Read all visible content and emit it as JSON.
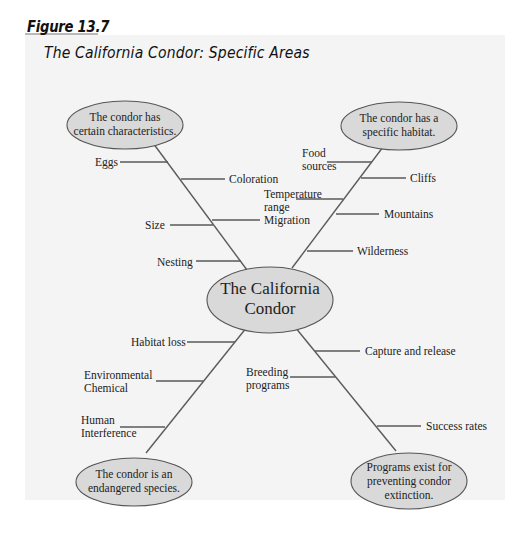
{
  "figure": {
    "label": "Figure 13.7",
    "title": "The California Condor: Specific Areas"
  },
  "colors": {
    "panel_bg": "#f4f4f4",
    "tab_bg": "#b9b9b9",
    "node_fill": "#d9d9d9",
    "line": "#555555"
  },
  "center": {
    "line1": "The California",
    "line2": "Condor"
  },
  "nodes": {
    "characteristics": {
      "line1": "The condor has",
      "line2": "certain characteristics.",
      "details": [
        "Eggs",
        "Coloration",
        "Size",
        "Migration",
        "Nesting"
      ]
    },
    "habitat": {
      "line1": "The condor has a",
      "line2": "specific habitat.",
      "details": [
        "Food sources",
        "Cliffs",
        "Temperature range",
        "Mountains",
        "Wilderness"
      ]
    },
    "endangered": {
      "line1": "The condor is an",
      "line2": "endangered species.",
      "details": [
        "Habitat loss",
        "Environmental Chemical",
        "Human Interference"
      ]
    },
    "programs": {
      "line1": "Programs exist for",
      "line2": "preventing condor",
      "line3": "extinction.",
      "details": [
        "Capture and release",
        "Breeding programs",
        "Success rates"
      ]
    }
  },
  "labels": {
    "eggs": "Eggs",
    "coloration": "Coloration",
    "size": "Size",
    "migration": "Migration",
    "nesting": "Nesting",
    "food_1": "Food",
    "food_2": "sources",
    "cliffs": "Cliffs",
    "temp_1": "Temperature",
    "temp_2": "range",
    "mountains": "Mountains",
    "wilderness": "Wilderness",
    "habitat_loss": "Habitat loss",
    "env_1": "Environmental",
    "env_2": "Chemical",
    "human_1": "Human",
    "human_2": "Interference",
    "breeding_1": "Breeding",
    "breeding_2": "programs",
    "capture": "Capture and release",
    "success": "Success rates"
  }
}
